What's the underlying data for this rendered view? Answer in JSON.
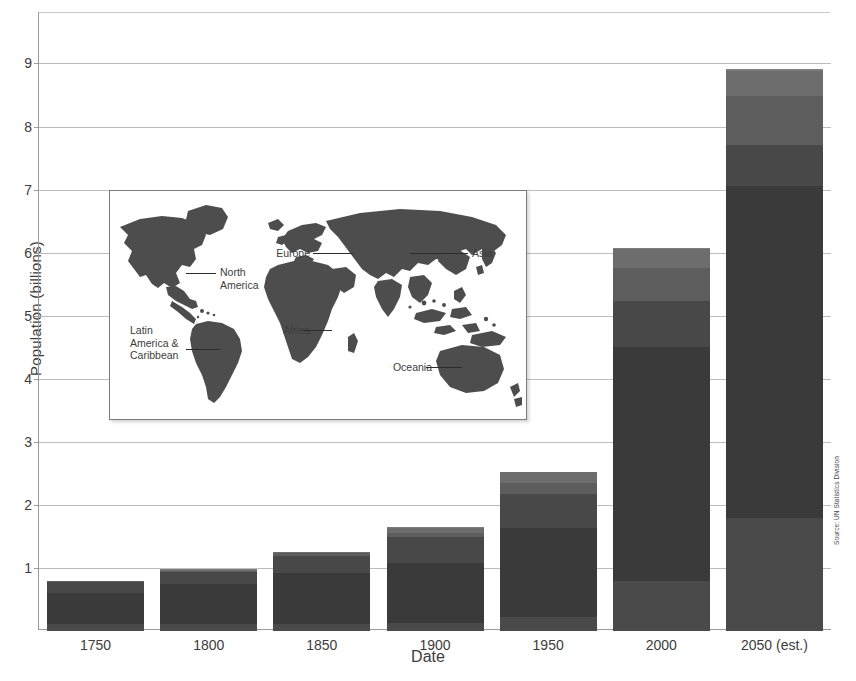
{
  "chart_data": {
    "type": "bar",
    "stacked": true,
    "title": "",
    "xlabel": "Date",
    "ylabel": "Population (billions)",
    "categories": [
      "1750",
      "1800",
      "1850",
      "1900",
      "1950",
      "2000",
      "2050 (est.)"
    ],
    "ylim": [
      0,
      9.8
    ],
    "yticks": [
      1,
      2,
      3,
      4,
      5,
      6,
      7,
      8,
      9
    ],
    "ytick_labels": [
      "1",
      "2",
      "3",
      "4",
      "5",
      "6",
      "7",
      "8",
      "9"
    ],
    "grid": true,
    "legend": "none",
    "totals": [
      0.79,
      0.98,
      1.26,
      1.65,
      2.52,
      6.07,
      8.91
    ],
    "series": [
      {
        "name": "Africa",
        "color": "#4a4a4a",
        "values": [
          0.11,
          0.11,
          0.11,
          0.13,
          0.23,
          0.8,
          1.8
        ]
      },
      {
        "name": "Asia",
        "color": "#3a3a3a",
        "values": [
          0.5,
          0.63,
          0.81,
          0.95,
          1.4,
          3.7,
          5.25
        ]
      },
      {
        "name": "Europe",
        "color": "#484848",
        "values": [
          0.16,
          0.2,
          0.27,
          0.41,
          0.55,
          0.73,
          0.65
        ]
      },
      {
        "name": "Latin America & Caribbean",
        "color": "#5d5d5d",
        "values": [
          0.02,
          0.02,
          0.04,
          0.07,
          0.17,
          0.52,
          0.78
        ]
      },
      {
        "name": "North America",
        "color": "#6d6d6d",
        "values": [
          0.0,
          0.01,
          0.03,
          0.08,
          0.17,
          0.31,
          0.4
        ]
      },
      {
        "name": "Oceania",
        "color": "#7d7d7d",
        "values": [
          0.0,
          0.01,
          0.0,
          0.01,
          0.0,
          0.01,
          0.03
        ]
      }
    ],
    "axis_note": "Source: UN Statistics Division"
  },
  "axes": {
    "y_title": "Population (billions)",
    "x_title": "Date",
    "y_tick_labels": [
      "1",
      "2",
      "3",
      "4",
      "5",
      "6",
      "7",
      "8",
      "9"
    ],
    "x_tick_labels": [
      "1750",
      "1800",
      "1850",
      "1900",
      "1950",
      "2000",
      "2050 (est.)"
    ]
  },
  "source": {
    "text": "Source: UN Statistics Division"
  },
  "map_inset": {
    "labels": [
      {
        "id": "europe",
        "text": "Europe"
      },
      {
        "id": "asia",
        "text": "Asia"
      },
      {
        "id": "north-america",
        "text": "North\nAmerica"
      },
      {
        "id": "latin-america",
        "text": "Latin\nAmerica &\nCaribbean"
      },
      {
        "id": "africa",
        "text": "Africa"
      },
      {
        "id": "oceania",
        "text": "Oceania"
      }
    ],
    "landmass_color": "#4d4d4d",
    "background_color": "#ffffff"
  },
  "colors": {
    "bar_dark": "#3a3a3a",
    "bar_mid": "#4d4d4d",
    "bar_light": "#6f6f6f",
    "grid": "#bdbdbd",
    "axis": "#9a9a9a",
    "text": "#3c3c3c"
  }
}
